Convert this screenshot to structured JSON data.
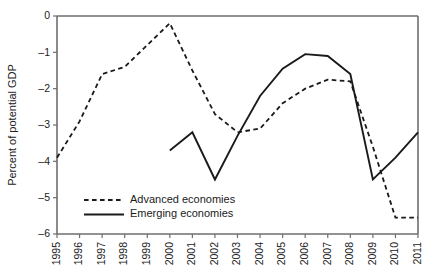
{
  "chart_data": {
    "type": "line",
    "title": "",
    "xlabel": "",
    "ylabel": "Percent of potential GDP",
    "xlim": [
      1995,
      2011
    ],
    "ylim": [
      -6,
      0
    ],
    "grid": false,
    "legend_position": "bottom-left-inside",
    "x": [
      1995,
      1996,
      1997,
      1998,
      1999,
      2000,
      2001,
      2002,
      2003,
      2004,
      2005,
      2006,
      2007,
      2008,
      2009,
      2010,
      2011
    ],
    "xtick_labels": [
      "1995",
      "1996",
      "1997",
      "1998",
      "1999",
      "2000",
      "2001",
      "2002",
      "2003",
      "2004",
      "2005",
      "2006",
      "2007",
      "2008",
      "2009",
      "2010",
      "2011"
    ],
    "ytick_values": [
      0,
      -1,
      -2,
      -3,
      -4,
      -5,
      -6
    ],
    "ytick_labels": [
      "0",
      "–1",
      "–2",
      "–3",
      "–4",
      "–5",
      "–6"
    ],
    "series": [
      {
        "name": "Advanced economies",
        "style": "dashed",
        "color": "#1a1a1a",
        "x": [
          1995,
          1996,
          1997,
          1998,
          1999,
          2000,
          2001,
          2002,
          2003,
          2004,
          2005,
          2006,
          2007,
          2008,
          2009,
          2010,
          2011
        ],
        "values": [
          -3.9,
          -2.9,
          -1.6,
          -1.4,
          -0.8,
          -0.2,
          -1.5,
          -2.7,
          -3.2,
          -3.1,
          -2.4,
          -2.0,
          -1.75,
          -1.8,
          -3.6,
          -5.55,
          -5.55
        ]
      },
      {
        "name": "Emerging economies",
        "style": "solid",
        "color": "#1a1a1a",
        "x": [
          2000,
          2001,
          2002,
          2003,
          2004,
          2005,
          2006,
          2007,
          2008,
          2009,
          2010,
          2011
        ],
        "values": [
          -3.7,
          -3.2,
          -4.5,
          -3.3,
          -2.2,
          -1.45,
          -1.05,
          -1.1,
          -1.6,
          -4.5,
          -3.9,
          -3.2
        ]
      }
    ],
    "legend": [
      {
        "label": "Advanced economies",
        "style": "dashed"
      },
      {
        "label": "Emerging economies",
        "style": "solid"
      }
    ]
  }
}
